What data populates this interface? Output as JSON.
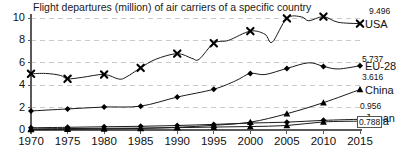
{
  "chart_data": {
    "type": "line",
    "title": "Flight departures (million) of air carriers of a specific country",
    "xlabel": "",
    "ylabel": "",
    "xlim": [
      1970,
      2015
    ],
    "ylim": [
      0,
      10
    ],
    "grid": true,
    "legend_position": "right-inline-labels",
    "x_ticks": [
      "1970",
      "1975",
      "1980",
      "1985",
      "1990",
      "1995",
      "2000",
      "2005",
      "2010",
      "2015"
    ],
    "y_ticks": [
      "0",
      "2",
      "4",
      "6",
      "8",
      "10"
    ],
    "x": [
      1970,
      1975,
      1980,
      1985,
      1990,
      1995,
      2000,
      2005,
      2010,
      2015
    ],
    "series": [
      {
        "name": "USA",
        "marker": "x-cross",
        "end_value_label": "9.496",
        "values": [
          5.02,
          4.57,
          4.96,
          5.55,
          6.82,
          7.75,
          8.83,
          9.97,
          10.12,
          9.496
        ],
        "dense_x": [
          1970,
          1972,
          1974,
          1975,
          1977,
          1980,
          1982,
          1983,
          1985,
          1987,
          1990,
          1992,
          1993,
          1995,
          1997,
          2000,
          2002,
          2003,
          2005,
          2007,
          2008,
          2010,
          2012,
          2015
        ],
        "dense_y": [
          5.02,
          5.05,
          4.88,
          4.57,
          4.7,
          4.96,
          4.55,
          4.72,
          5.55,
          6.3,
          6.82,
          6.4,
          6.32,
          7.75,
          8.0,
          8.83,
          8.55,
          7.85,
          9.97,
          10.1,
          9.75,
          10.12,
          9.62,
          9.496
        ]
      },
      {
        "name": "EU-28",
        "marker": "diamond",
        "end_value_label": "5.737",
        "values": [
          1.7,
          1.88,
          2.05,
          2.13,
          2.94,
          3.64,
          5.05,
          5.5,
          5.68,
          5.737
        ],
        "dense_x": [
          1970,
          1975,
          1980,
          1985,
          1990,
          1995,
          1998,
          2000,
          2002,
          2005,
          2008,
          2010,
          2012,
          2015
        ],
        "dense_y": [
          1.7,
          1.88,
          2.05,
          2.13,
          2.94,
          3.64,
          4.4,
          5.05,
          4.95,
          5.5,
          6.0,
          5.68,
          5.45,
          5.737
        ]
      },
      {
        "name": "China",
        "marker": "triangle",
        "end_value_label": "3.616",
        "values": [
          0.04,
          0.06,
          0.09,
          0.14,
          0.24,
          0.42,
          0.7,
          1.45,
          2.44,
          3.616
        ],
        "dense_x": [
          1970,
          1975,
          1980,
          1985,
          1990,
          1995,
          2000,
          2005,
          2010,
          2015
        ],
        "dense_y": [
          0.04,
          0.06,
          0.09,
          0.14,
          0.24,
          0.42,
          0.7,
          1.45,
          2.44,
          3.616
        ]
      },
      {
        "name": "Japan",
        "marker": "diamond",
        "end_value_label": "0.956",
        "values": [
          0.2,
          0.24,
          0.29,
          0.33,
          0.4,
          0.5,
          0.62,
          0.7,
          0.86,
          0.956
        ],
        "dense_x": [
          1970,
          1975,
          1980,
          1985,
          1990,
          1995,
          2000,
          2005,
          2010,
          2015
        ],
        "dense_y": [
          0.2,
          0.24,
          0.29,
          0.33,
          0.4,
          0.5,
          0.62,
          0.7,
          0.86,
          0.956
        ]
      },
      {
        "name": "India",
        "marker": "triangle",
        "end_value_label": "0.788",
        "values": [
          0.1,
          0.13,
          0.15,
          0.17,
          0.21,
          0.26,
          0.31,
          0.4,
          0.72,
          0.788
        ],
        "dense_x": [
          1970,
          1975,
          1980,
          1985,
          1990,
          1995,
          2000,
          2005,
          2010,
          2015
        ],
        "dense_y": [
          0.1,
          0.13,
          0.15,
          0.17,
          0.21,
          0.26,
          0.31,
          0.4,
          0.72,
          0.788
        ]
      }
    ]
  },
  "style": {
    "line_color": "#1a1a1a",
    "marker_color": "#000000",
    "grid_color": "#bdbdbd",
    "axis_color": "#595959",
    "background": "#ffffff"
  }
}
